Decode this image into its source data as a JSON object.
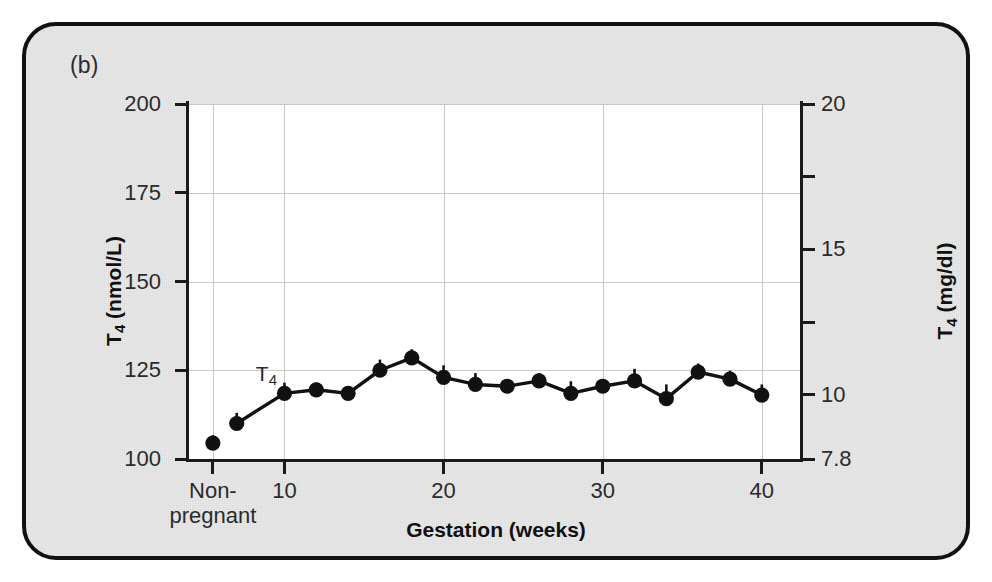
{
  "figure": {
    "panel_label": "(b)",
    "background_color": "#e9e9e9",
    "border_color": "#111111"
  },
  "annotations": [
    {
      "text": "T4",
      "text_base": "T",
      "text_sub": "4",
      "x_week": 8.2,
      "y_value": 123.5
    }
  ],
  "chart_data": {
    "type": "line",
    "title": "",
    "xlabel": "Gestation (weeks)",
    "ylabel": "T4 (nmol/L)",
    "ylabel_base": "T",
    "ylabel_sub": "4",
    "ylabel_rest": " (nmol/L)",
    "ylabel_secondary": "T4 (mg/dl)",
    "ylabel_secondary_base": "T",
    "ylabel_secondary_sub": "4",
    "ylabel_secondary_rest": " (mg/dl)",
    "xlim": [
      4.0,
      42.4
    ],
    "ylim": [
      100,
      200
    ],
    "y2lim": [
      7.8,
      20
    ],
    "grid": true,
    "legend": "none",
    "series_color": "#111111",
    "marker": "circle",
    "error_bars": "upper-only (SEM)",
    "yticks": [
      100,
      125,
      150,
      175,
      200
    ],
    "ytick_labels": [
      "100",
      "125",
      "150",
      "175",
      "200"
    ],
    "y2ticks": [
      7.8,
      10,
      12.5,
      15,
      17.5,
      20
    ],
    "y2tick_labels": [
      "7.8",
      "10",
      "",
      "15",
      "",
      "20"
    ],
    "xticks": [
      10,
      20,
      30,
      40
    ],
    "xtick_labels": [
      "10",
      "20",
      "30",
      "40"
    ],
    "offscale_category": {
      "label_line1": "Non-",
      "label_line2": "pregnant",
      "x_week": 5.5,
      "value": 104.5,
      "error": 2.2
    },
    "x": [
      7,
      10,
      12,
      14,
      16,
      18,
      20,
      22,
      24,
      26,
      28,
      30,
      32,
      34,
      36,
      38,
      40
    ],
    "values": [
      110.0,
      118.5,
      119.5,
      118.5,
      125.0,
      128.5,
      123.0,
      121.0,
      120.5,
      122.0,
      118.5,
      120.5,
      122.0,
      117.0,
      124.5,
      122.5,
      118.0
    ],
    "errors": [
      3.0,
      3.0,
      2.0,
      1.6,
      3.0,
      2.4,
      3.4,
      3.2,
      1.6,
      2.2,
      3.4,
      1.8,
      3.4,
      4.0,
      2.4,
      2.4,
      3.0
    ],
    "series": [
      {
        "name": "T4",
        "values": [
          110.0,
          118.5,
          119.5,
          118.5,
          125.0,
          128.5,
          123.0,
          121.0,
          120.5,
          122.0,
          118.5,
          120.5,
          122.0,
          117.0,
          124.5,
          122.5,
          118.0
        ]
      }
    ]
  }
}
